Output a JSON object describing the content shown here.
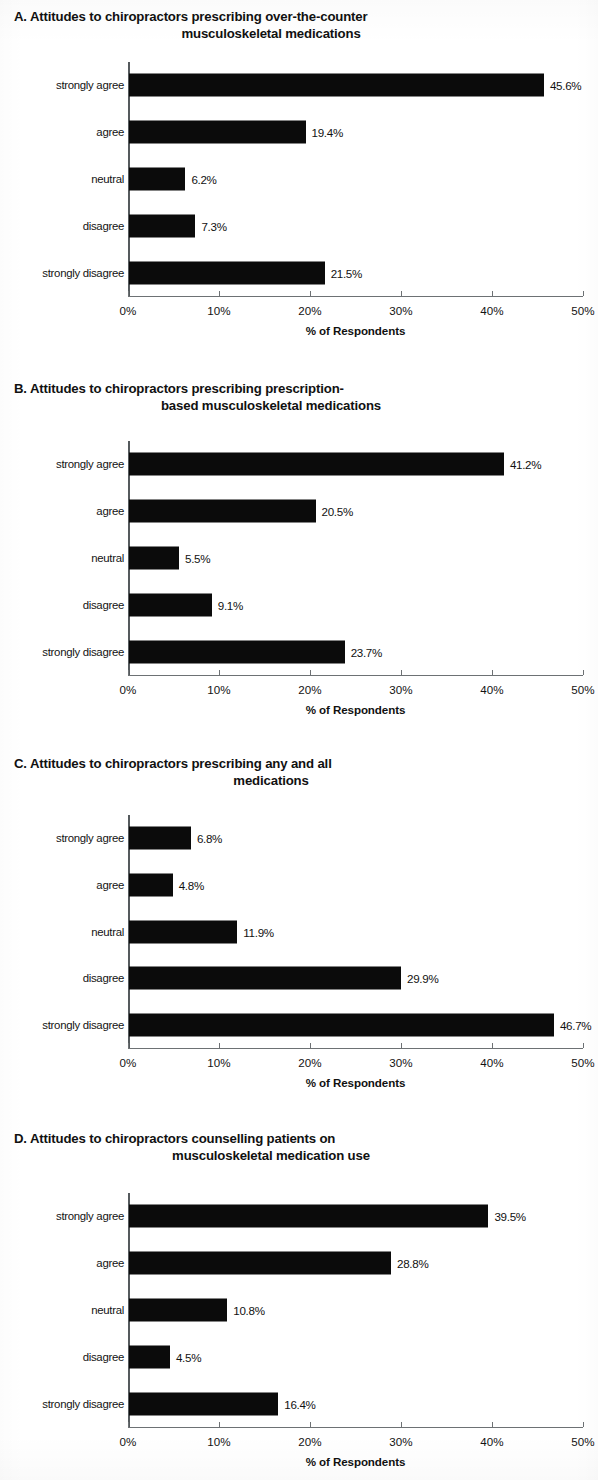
{
  "figure": {
    "axis_title": "% of Respondents",
    "x_ticks": [
      "0%",
      "10%",
      "20%",
      "30%",
      "40%",
      "50%"
    ],
    "categories": [
      "strongly agree",
      "agree",
      "neutral",
      "disagree",
      "strongly disagree"
    ],
    "bar_color": "#0b0b0b",
    "axis_color": "#6d7174"
  },
  "chart_data": [
    {
      "id": "A",
      "type": "bar",
      "orientation": "horizontal",
      "title": "A. Attitudes to chiropractors prescribing over-the-counter\nmusculoskeletal medications",
      "title_line1": "A. Attitudes to chiropractors prescribing over-the-counter",
      "title_line2": "musculoskeletal medications",
      "xlabel": "% of Respondents",
      "ylabel": "",
      "categories": [
        "strongly agree",
        "agree",
        "neutral",
        "disagree",
        "strongly disagree"
      ],
      "values": [
        45.6,
        19.4,
        6.2,
        7.3,
        21.5
      ],
      "labels": [
        "45.6%",
        "19.4%",
        "6.2%",
        "7.3%",
        "21.5%"
      ],
      "xlim": [
        0,
        50
      ],
      "xticks": [
        0,
        10,
        20,
        30,
        40,
        50
      ],
      "xtick_labels": [
        "0%",
        "10%",
        "20%",
        "30%",
        "40%",
        "50%"
      ],
      "grid": false,
      "legend": null
    },
    {
      "id": "B",
      "type": "bar",
      "orientation": "horizontal",
      "title": "B. Attitudes to chiropractors prescribing prescription-\nbased musculoskeletal medications",
      "title_line1": "B. Attitudes to chiropractors prescribing prescription-",
      "title_line2": "based musculoskeletal medications",
      "xlabel": "% of Respondents",
      "ylabel": "",
      "categories": [
        "strongly agree",
        "agree",
        "neutral",
        "disagree",
        "strongly disagree"
      ],
      "values": [
        41.2,
        20.5,
        5.5,
        9.1,
        23.7
      ],
      "labels": [
        "41.2%",
        "20.5%",
        "5.5%",
        "9.1%",
        "23.7%"
      ],
      "xlim": [
        0,
        50
      ],
      "xticks": [
        0,
        10,
        20,
        30,
        40,
        50
      ],
      "xtick_labels": [
        "0%",
        "10%",
        "20%",
        "30%",
        "40%",
        "50%"
      ],
      "grid": false,
      "legend": null
    },
    {
      "id": "C",
      "type": "bar",
      "orientation": "horizontal",
      "title": "C. Attitudes to chiropractors prescribing any and all\nmedications",
      "title_line1": "C. Attitudes to chiropractors prescribing any and all",
      "title_line2": "medications",
      "xlabel": "% of Respondents",
      "ylabel": "",
      "categories": [
        "strongly agree",
        "agree",
        "neutral",
        "disagree",
        "strongly disagree"
      ],
      "values": [
        6.8,
        4.8,
        11.9,
        29.9,
        46.7
      ],
      "labels": [
        "6.8%",
        "4.8%",
        "11.9%",
        "29.9%",
        "46.7%"
      ],
      "xlim": [
        0,
        50
      ],
      "xticks": [
        0,
        10,
        20,
        30,
        40,
        50
      ],
      "xtick_labels": [
        "0%",
        "10%",
        "20%",
        "30%",
        "40%",
        "50%"
      ],
      "grid": false,
      "legend": null
    },
    {
      "id": "D",
      "type": "bar",
      "orientation": "horizontal",
      "title": "D. Attitudes to chiropractors counselling patients on\nmusculoskeletal medication use",
      "title_line1": "D. Attitudes to chiropractors counselling patients on",
      "title_line2": "musculoskeletal medication use",
      "xlabel": "% of Respondents",
      "ylabel": "",
      "categories": [
        "strongly agree",
        "agree",
        "neutral",
        "disagree",
        "strongly disagree"
      ],
      "values": [
        39.5,
        28.8,
        10.8,
        4.5,
        16.4
      ],
      "labels": [
        "39.5%",
        "28.8%",
        "10.8%",
        "4.5%",
        "16.4%"
      ],
      "xlim": [
        0,
        50
      ],
      "xticks": [
        0,
        10,
        20,
        30,
        40,
        50
      ],
      "xtick_labels": [
        "0%",
        "10%",
        "20%",
        "30%",
        "40%",
        "50%"
      ],
      "grid": false,
      "legend": null
    }
  ]
}
